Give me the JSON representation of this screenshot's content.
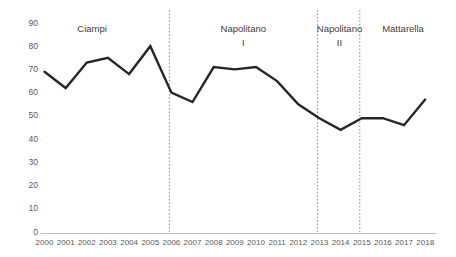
{
  "chart_data": {
    "type": "line",
    "title": "",
    "xlabel": "",
    "ylabel": "",
    "x": [
      2000,
      2001,
      2002,
      2003,
      2004,
      2005,
      2006,
      2007,
      2008,
      2009,
      2010,
      2011,
      2012,
      2013,
      2014,
      2015,
      2016,
      2017,
      2018
    ],
    "values": [
      69,
      62,
      73,
      75,
      68,
      80,
      60,
      56,
      71,
      70,
      71,
      65,
      55,
      49,
      44,
      49,
      49,
      46,
      57
    ],
    "ylim": [
      0,
      90
    ],
    "y_ticks": [
      0,
      10,
      20,
      30,
      40,
      50,
      60,
      70,
      80,
      90
    ],
    "grid": false,
    "legend": "none",
    "separator_years": [
      2006,
      2013,
      2015
    ],
    "annotations": [
      {
        "lines": [
          "Ciampi"
        ],
        "center_year": 2002.25
      },
      {
        "lines": [
          "Napolitano",
          "I"
        ],
        "center_year": 2009.4
      },
      {
        "lines": [
          "Napolitano",
          "II"
        ],
        "center_year": 2013.95
      },
      {
        "lines": [
          "Mattarella"
        ],
        "center_year": 2016.95
      }
    ],
    "colors": {
      "line": "#262626",
      "separator": "#8c8c8c",
      "axis": "#bfbfbf",
      "tick_text": "#595959",
      "annotation_text": "#404040"
    }
  }
}
